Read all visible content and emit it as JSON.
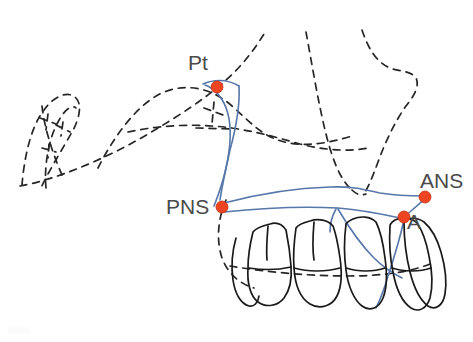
{
  "figure": {
    "kind": "cephalometric-tracing",
    "background_color": "#ffffff",
    "width": 473,
    "height": 342
  },
  "colors": {
    "landmark_dot": "#EE4422",
    "landmark_dot_stroke": "#C03318",
    "maxilla_outline": "#5577AA",
    "skull_outline": "#262626",
    "teeth_outline": "#1A1A1A",
    "label_text": "#4A4A4A"
  },
  "labels": {
    "pt": "Pt",
    "pns": "PNS",
    "ans": "ANS",
    "a": "A"
  },
  "landmarks": [
    {
      "id": "pt",
      "label": "Pt",
      "x": 217,
      "y": 87,
      "radius": 6,
      "description": "Pterygomaxillary fissure point"
    },
    {
      "id": "pns",
      "label": "PNS",
      "x": 222,
      "y": 207,
      "radius": 6,
      "description": "Posterior nasal spine"
    },
    {
      "id": "ans",
      "label": "ANS",
      "x": 425,
      "y": 197,
      "radius": 6,
      "description": "Anterior nasal spine"
    },
    {
      "id": "a",
      "label": "A",
      "x": 404,
      "y": 217,
      "radius": 6,
      "description": "Point A, subspinale"
    }
  ],
  "strokes": {
    "maxilla_width": 1.6,
    "skull_width": 1.7,
    "teeth_width": 1.7,
    "dash_pattern": "7 6"
  }
}
